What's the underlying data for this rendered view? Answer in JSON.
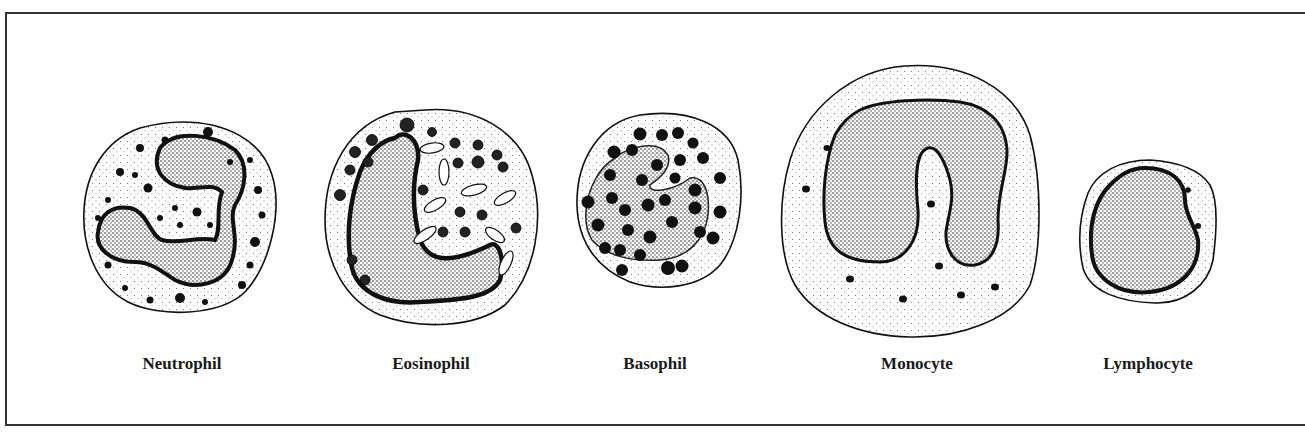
{
  "figure": {
    "type": "white-blood-cell-illustration",
    "cells": [
      {
        "id": "neutrophil",
        "label": "Neutrophil",
        "center_x": 182
      },
      {
        "id": "eosinophil",
        "label": "Eosinophil",
        "center_x": 431
      },
      {
        "id": "basophil",
        "label": "Basophil",
        "center_x": 655
      },
      {
        "id": "monocyte",
        "label": "Monocyte",
        "center_x": 917
      },
      {
        "id": "lymphocyte",
        "label": "Lymphocyte",
        "center_x": 1148
      }
    ],
    "colors": {
      "ink": "#111111",
      "paper": "#ffffff",
      "stipple": "#555555"
    }
  }
}
